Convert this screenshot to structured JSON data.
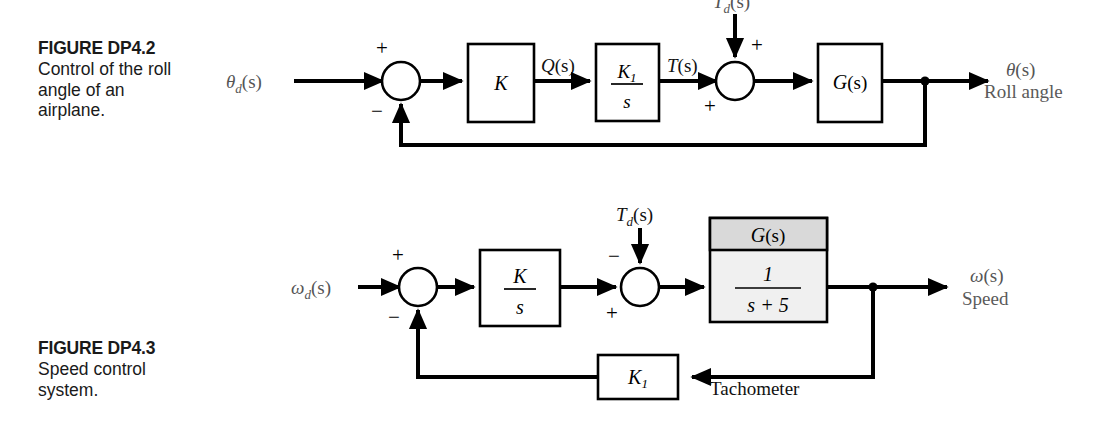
{
  "page": {
    "background": "#ffffff",
    "width": 1115,
    "height": 422,
    "ink_color": "#000000",
    "label_gray": "#555555"
  },
  "figures": [
    {
      "id": "dp4-2",
      "caption_title": "FIGURE DP4.2",
      "caption_body": "Control of the roll\nangle of an\nairplane.",
      "input_label": "θd(s)",
      "input_label_base": "θ",
      "input_label_sub": "d",
      "input_label_paren": "(s)",
      "output_label_base": "θ",
      "output_label_paren": "(s)",
      "output_description": "Roll angle",
      "disturbance_base": "T",
      "disturbance_sub": "d",
      "disturbance_paren": "(s)",
      "signal_q_base": "Q",
      "signal_q_paren": "(s)",
      "signal_t_base": "T",
      "signal_t_paren": "(s)",
      "blocks": [
        {
          "name": "gain-k",
          "text": "K",
          "type": "plain"
        },
        {
          "name": "integrator-k1-s",
          "numerator": "K1",
          "numerator_base": "K",
          "numerator_sub": "1",
          "denominator": "s",
          "type": "fraction"
        },
        {
          "name": "plant-g-s",
          "text_base": "G",
          "text_paren": "(s)",
          "type": "plain"
        }
      ],
      "summing_junctions": [
        {
          "name": "error-junction",
          "input_sign": "+",
          "feedback_sign": "−"
        },
        {
          "name": "disturbance-junction",
          "disturbance_sign": "+",
          "forward_sign": "+"
        }
      ]
    },
    {
      "id": "dp4-3",
      "caption_title": "FIGURE DP4.3",
      "caption_body": "Speed control\nsystem.",
      "input_label_base": "ω",
      "input_label_sub": "d",
      "input_label_paren": "(s)",
      "output_label_base": "ω",
      "output_label_paren": "(s)",
      "output_description": "Speed",
      "disturbance_base": "T",
      "disturbance_sub": "d",
      "disturbance_paren": "(s)",
      "feedback_label": "Tachometer",
      "blocks": [
        {
          "name": "controller-k-s",
          "numerator": "K",
          "denominator": "s",
          "type": "fraction"
        },
        {
          "name": "plant-g-s",
          "header": "G(s)",
          "header_base": "G",
          "header_paren": "(s)",
          "numerator": "1",
          "denominator": "s + 5",
          "type": "fraction-titled"
        },
        {
          "name": "tachometer-gain-k1",
          "text_base": "K",
          "text_sub": "1",
          "type": "plain"
        }
      ],
      "summing_junctions": [
        {
          "name": "error-junction",
          "input_sign": "+",
          "feedback_sign": "−"
        },
        {
          "name": "disturbance-junction",
          "disturbance_sign": "−",
          "forward_sign": "+"
        }
      ]
    }
  ]
}
